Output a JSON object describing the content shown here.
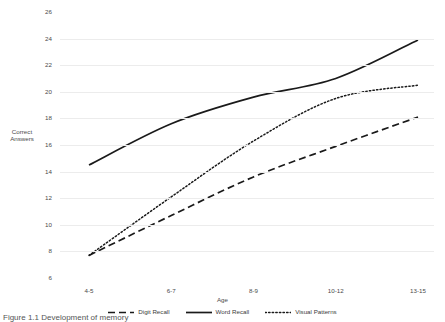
{
  "chart_data": {
    "type": "line",
    "title": "",
    "xlabel": "Age",
    "ylabel": "Correct Answers",
    "categories": [
      "4-5",
      "6-7",
      "8-9",
      "10-12",
      "13-15"
    ],
    "ylim": [
      6,
      26
    ],
    "yticks": [
      26,
      24,
      22,
      20,
      18,
      16,
      14,
      12,
      10,
      8,
      6
    ],
    "grid": "horizontal",
    "legend_position": "bottom",
    "series": [
      {
        "name": "Digit Recall",
        "style": "dashed",
        "color": "#1a1a1a",
        "values": [
          7.7,
          10.7,
          13.6,
          15.9,
          18.1
        ]
      },
      {
        "name": "Word Recall",
        "style": "solid",
        "color": "#1a1a1a",
        "values": [
          14.5,
          17.6,
          19.6,
          21.0,
          23.9
        ]
      },
      {
        "name": "Visual Patterns",
        "style": "dotted",
        "color": "#1a1a1a",
        "values": [
          7.7,
          12.1,
          16.3,
          19.5,
          20.5
        ]
      }
    ]
  },
  "axes": {
    "y_title_line1": "Correct",
    "y_title_line2": "Answers",
    "x_title": "Age"
  },
  "caption": {
    "text": "Figure 1.1  Development of memory"
  },
  "colors": {
    "line": "#1a1a1a",
    "grid": "#ececec",
    "text": "#4a4a4a",
    "background": "#ffffff"
  }
}
